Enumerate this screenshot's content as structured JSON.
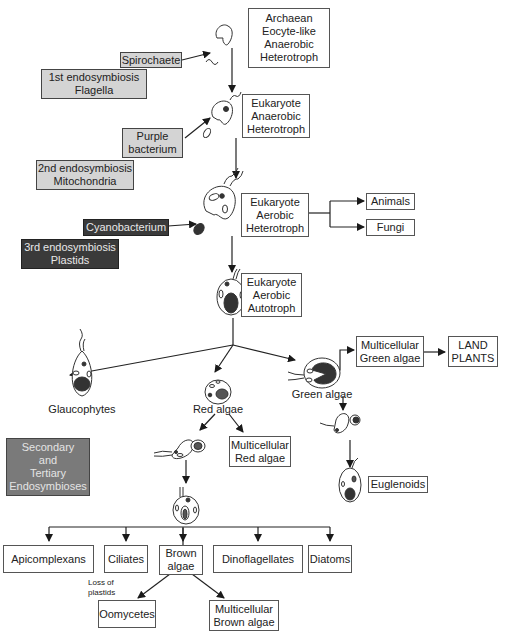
{
  "diagram": {
    "type": "evolutionary-endosymbiosis-flow",
    "stages": {
      "archaean": "Archaean\nEocyte-like\nAnaerobic\nHeterotroph",
      "eukaryote_anaerobic": "Eukaryote\nAnaerobic\nHeterotroph",
      "eukaryote_aerobic_heterotroph": "Eukaryote\nAerobic\nHeterotroph",
      "eukaryote_aerobic_autotroph": "Eukaryote\nAerobic\nAutotroph"
    },
    "inputs": {
      "spirochaete": "Spirochaete",
      "purple_bacterium": "Purple\nbacterium",
      "cyanobacterium": "Cyanobacterium"
    },
    "events": {
      "first": "1st endosymbiosis\nFlagella",
      "second": "2nd endosymbiosis\nMitochondria",
      "third": "3rd endosymbiosis\nPlastids",
      "secondary_tertiary": "Secondary\nand\nTertiary\nEndosymbioses"
    },
    "heterotroph_outputs": [
      "Animals",
      "Fungi"
    ],
    "lineages": {
      "glaucophytes": "Glaucophytes",
      "red_algae": "Red algae",
      "green_algae": "Green algae",
      "multicellular_red": "Multicellular\nRed algae",
      "multicellular_green": "Multicellular\nGreen algae",
      "land_plants": "LAND\nPLANTS",
      "euglenoids": "Euglenoids"
    },
    "secondary_outputs": [
      "Apicomplexans",
      "Ciliates",
      "Brown\nalgae",
      "Dinoflagellates",
      "Diatoms"
    ],
    "brown_algae_outputs": {
      "loss_note": "Loss of\nplastids",
      "oomycetes": "Oomycetes",
      "multicellular_brown": "Multicellular\nBrown algae"
    },
    "colors": {
      "light_box": "#d4d4d4",
      "dark_box": "#3a3a3a",
      "mid_box": "#7a7a7a",
      "line": "#222222"
    }
  }
}
